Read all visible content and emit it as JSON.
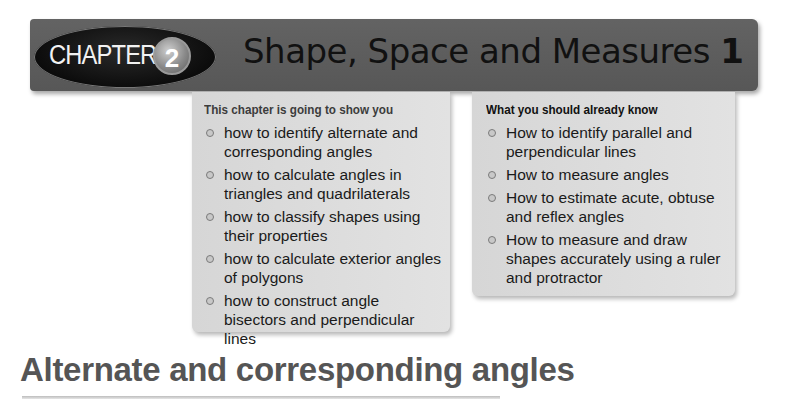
{
  "banner": {
    "chapter_label": "CHAPTER",
    "chapter_number": "2",
    "title_text": "Shape, Space and Measures",
    "title_number": "1"
  },
  "left_box": {
    "heading": "This chapter is going to show you",
    "items": [
      {
        "text": "how to identify alternate and corresponding angles"
      },
      {
        "text": "how to calculate angles in triangles and quadrilaterals"
      },
      {
        "text": "how to classify shapes using their properties"
      },
      {
        "text": "how to calculate exterior angles of polygons"
      },
      {
        "text": "how to construct angle bisectors and perpendicular lines"
      }
    ]
  },
  "right_box": {
    "heading": "What you should already know",
    "items": [
      {
        "text": "How to identify parallel and perpendicular lines"
      },
      {
        "text": "How to measure angles"
      },
      {
        "text": "How to estimate acute, obtuse and reflex angles"
      },
      {
        "text": "How to measure and draw shapes accurately using a ruler and protractor"
      }
    ]
  },
  "section": {
    "title": "Alternate and corresponding angles"
  },
  "colors": {
    "banner_bg": "#5a5a5a",
    "oval_bg": "#111111",
    "box_bg": "#dcdcdc",
    "section_title": "#555555"
  }
}
